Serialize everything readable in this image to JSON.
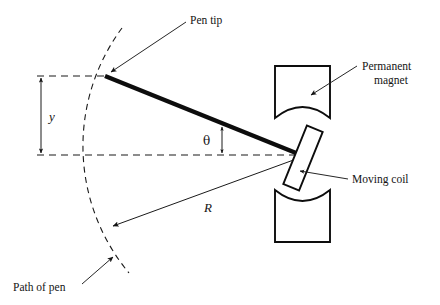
{
  "figure": {
    "type": "technical-line-diagram",
    "background_color": "#ffffff",
    "line_color": "#1a1a1a"
  },
  "labels": {
    "pen_tip": "Pen tip",
    "permanent_magnet_line1": "Permanent",
    "permanent_magnet_line2": "magnet",
    "moving_coil": "Moving coil",
    "path_of_pen": "Path of pen",
    "deflection_y": "y",
    "angle_theta": "θ",
    "radius_R": "R"
  },
  "geometry": {
    "pivot": {
      "x": 302,
      "y": 155
    },
    "pen_tip": {
      "x": 104,
      "y": 76
    },
    "arc_radius": 198,
    "arc_top": {
      "x": 122,
      "y": 28
    },
    "arc_bottom": {
      "x": 129,
      "y": 273
    },
    "r_arrow_end": {
      "x": 113,
      "y": 226
    },
    "y_dim_x": 41,
    "y_top": 76,
    "y_bottom": 155,
    "dashed_top_y": 76,
    "dashed_bottom_y": 155,
    "dashed_left_x": 37,
    "theta_arrow_x": 222,
    "magnet_top": {
      "x": 275,
      "y": 66,
      "w": 55,
      "h": 52
    },
    "magnet_bottom": {
      "x": 275,
      "y": 190,
      "w": 55,
      "h": 52
    },
    "coil": {
      "cx": 303,
      "cy": 158,
      "w": 17,
      "h": 63,
      "rotation_deg": 22
    }
  },
  "leaders": [
    {
      "name": "pen-tip-leader",
      "from": {
        "x": 186,
        "y": 22
      },
      "to": {
        "x": 110,
        "y": 73
      }
    },
    {
      "name": "permanent-magnet-leader",
      "from": {
        "x": 356,
        "y": 66
      },
      "to": {
        "x": 310,
        "y": 95
      }
    },
    {
      "name": "moving-coil-leader",
      "from": {
        "x": 348,
        "y": 178
      },
      "to": {
        "x": 299,
        "y": 172
      }
    },
    {
      "name": "path-of-pen-leader",
      "from": {
        "x": 82,
        "y": 283
      },
      "to": {
        "x": 112,
        "y": 258
      }
    }
  ]
}
